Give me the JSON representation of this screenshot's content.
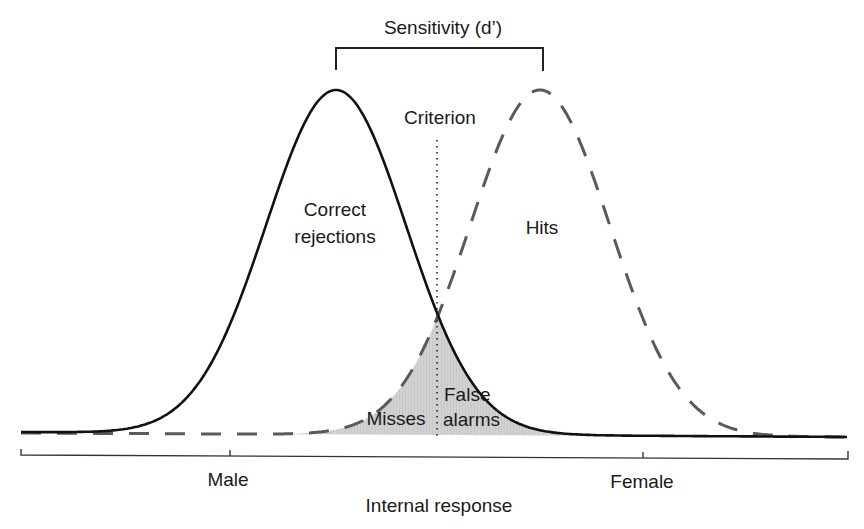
{
  "title": "Sensitivity (d’)",
  "criterion_label": "Criterion",
  "regions": {
    "correct_rejections": [
      "Correct",
      "rejections"
    ],
    "hits": "Hits",
    "misses": "Misses",
    "false_alarms": [
      "False",
      "alarms"
    ]
  },
  "axis": {
    "label": "Internal response",
    "ticks": [
      "Male",
      "Female"
    ]
  },
  "colors": {
    "solid_curve": "#111111",
    "dashed_curve": "#5a5a5a",
    "shaded_region": "#cfcfcf",
    "text": "#1a1a1a"
  },
  "chart_data": {
    "type": "line",
    "title": "Sensitivity (d’)",
    "xlabel": "Internal response",
    "ylabel": "",
    "x_ticks": [
      "Male",
      "Female"
    ],
    "series": [
      {
        "name": "Male distribution (noise)",
        "style": "solid",
        "mean_px": 336,
        "peak_y_px": 90
      },
      {
        "name": "Female distribution (signal)",
        "style": "dashed",
        "mean_px": 540,
        "peak_y_px": 90
      }
    ],
    "criterion_x_px": 437,
    "annotations": [
      "Sensitivity (d’)",
      "Criterion",
      "Correct rejections",
      "Hits",
      "Misses",
      "False alarms"
    ],
    "shaded": "overlap region under both curves (Misses left of criterion, False alarms right of criterion)"
  }
}
